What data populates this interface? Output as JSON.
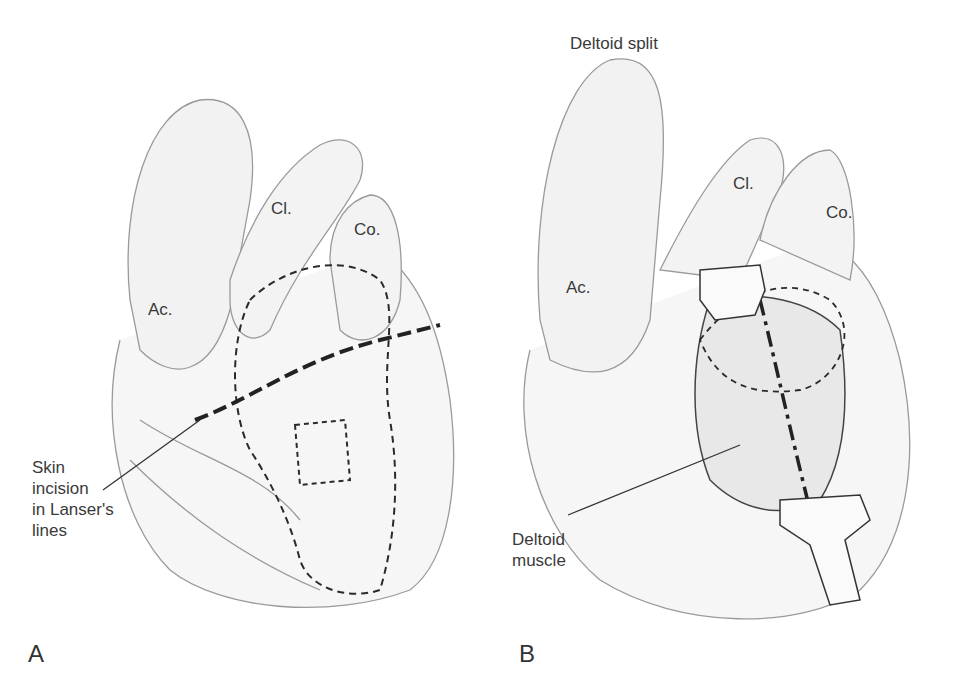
{
  "panels": [
    {
      "letter": "A",
      "labels": {
        "ac": "Ac.",
        "cl": "Cl.",
        "co": "Co."
      },
      "callout": [
        "Skin",
        "incision",
        "in Lanser's",
        "lines"
      ]
    },
    {
      "letter": "B",
      "title": "Deltoid split",
      "labels": {
        "ac": "Ac.",
        "cl": "Cl.",
        "co": "Co."
      },
      "callout": [
        "Deltoid",
        "muscle"
      ]
    }
  ],
  "colors": {
    "line": "#2a2a2a",
    "sketch": "#9a9a9a",
    "fill": "#f4f4f4"
  }
}
